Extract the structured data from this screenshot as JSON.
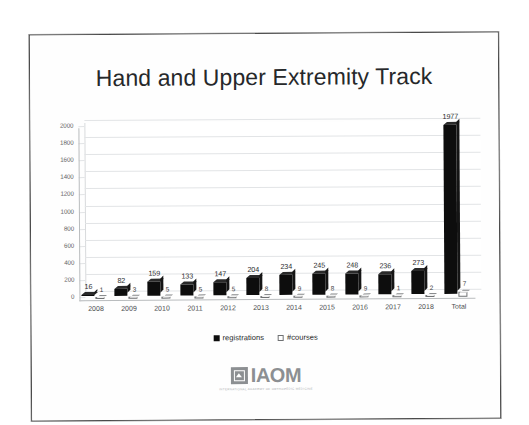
{
  "slide": {
    "title": "Hand and Upper Extremity Track"
  },
  "logo": {
    "word": "IAOM",
    "subtitle": "INTERNATIONAL ACADEMY OF ORTHOPEDIC MEDICINE",
    "mark_icon": "shield-house-icon"
  },
  "legend": {
    "items": [
      {
        "label": "registrations",
        "swatch": "filled"
      },
      {
        "label": "#courses",
        "swatch": "hollow"
      }
    ]
  },
  "chart_data": {
    "type": "bar",
    "title": "Hand and Upper Extremity Track",
    "xlabel": "",
    "ylabel": "",
    "ylim": [
      0,
      2000
    ],
    "yticks": [
      0,
      200,
      400,
      600,
      800,
      1000,
      1200,
      1400,
      1600,
      1800,
      2000
    ],
    "ytick_labels": [
      "0",
      "200",
      "400",
      "600",
      "800",
      "1000",
      "1200",
      "1400",
      "1600",
      "1800",
      "2000"
    ],
    "grid": true,
    "legend_position": "bottom",
    "categories": [
      "2008",
      "2009",
      "2010",
      "2011",
      "2012",
      "2013",
      "2014",
      "2015",
      "2016",
      "2017",
      "2018",
      "Total"
    ],
    "series": [
      {
        "name": "registrations",
        "color": "#0d0d0d",
        "values": [
          16,
          82,
          159,
          133,
          147,
          204,
          234,
          245,
          248,
          236,
          273,
          1977
        ],
        "labels": [
          "16",
          "82",
          "159",
          "133",
          "147",
          "204",
          "234",
          "245",
          "248",
          "236",
          "273",
          "1977"
        ]
      },
      {
        "name": "#courses",
        "color": "#ffffff",
        "values": [
          1,
          3,
          5,
          5,
          5,
          8,
          9,
          8,
          9,
          1,
          2,
          57
        ],
        "labels": [
          "1",
          "3",
          "5",
          "5",
          "5",
          "8",
          "9",
          "8",
          "9",
          "1",
          "2",
          "7"
        ]
      }
    ]
  }
}
